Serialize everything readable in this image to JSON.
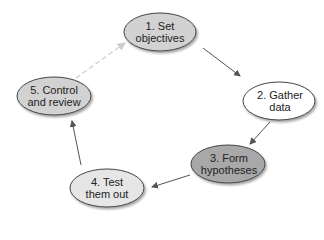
{
  "diagram": {
    "type": "cycle",
    "nodes": [
      {
        "id": 1,
        "line1": "1. Set",
        "line2": "objectives",
        "fill": "#d2d2d2"
      },
      {
        "id": 2,
        "line1": "2. Gather",
        "line2": "data",
        "fill": "#ffffff"
      },
      {
        "id": 3,
        "line1": "3. Form",
        "line2": "hypotheses",
        "fill": "#a8a8a8"
      },
      {
        "id": 4,
        "line1": "4. Test",
        "line2": "them out",
        "fill": "#e6e6e6"
      },
      {
        "id": 5,
        "line1": "5. Control",
        "line2": "and review",
        "fill": "#d2d2d2"
      }
    ],
    "edges": [
      {
        "from": 1,
        "to": 2,
        "style": "solid"
      },
      {
        "from": 2,
        "to": 3,
        "style": "solid"
      },
      {
        "from": 3,
        "to": 4,
        "style": "solid"
      },
      {
        "from": 4,
        "to": 5,
        "style": "solid"
      },
      {
        "from": 5,
        "to": 1,
        "style": "dashed"
      }
    ],
    "colors": {
      "stroke": "#555555",
      "arrow": "#555555",
      "dashed": "#cccccc"
    }
  }
}
